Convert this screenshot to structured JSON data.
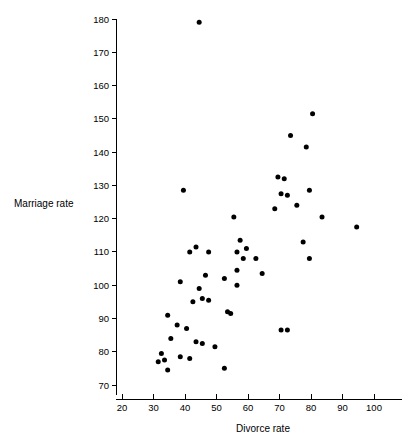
{
  "chart_data": {
    "type": "scatter",
    "title": "",
    "xlabel": "Divorce rate",
    "ylabel": "Marriage rate",
    "xlim": [
      15,
      108
    ],
    "ylim": [
      67,
      182
    ],
    "xticks": [
      20,
      30,
      40,
      50,
      60,
      70,
      80,
      90,
      100
    ],
    "yticks": [
      70,
      80,
      90,
      100,
      110,
      120,
      130,
      140,
      150,
      160,
      170,
      180
    ],
    "grid": false,
    "legend": null,
    "marker": "filled-circle",
    "marker_color": "#000000",
    "points": [
      [
        44.5,
        179
      ],
      [
        80.5,
        151.5
      ],
      [
        78.5,
        141.5
      ],
      [
        73.5,
        145
      ],
      [
        69.5,
        132.5
      ],
      [
        71.5,
        132
      ],
      [
        39.5,
        128.5
      ],
      [
        70.5,
        127.5
      ],
      [
        72.5,
        127
      ],
      [
        79.5,
        128.5
      ],
      [
        68.5,
        123
      ],
      [
        75.5,
        124
      ],
      [
        83.5,
        120.5
      ],
      [
        94.5,
        117.5
      ],
      [
        55.5,
        120.5
      ],
      [
        77.5,
        113
      ],
      [
        57.5,
        113.5
      ],
      [
        59.5,
        111
      ],
      [
        56.5,
        110
      ],
      [
        43.5,
        111.5
      ],
      [
        41.5,
        110
      ],
      [
        47.5,
        110
      ],
      [
        58.5,
        108
      ],
      [
        62.5,
        108
      ],
      [
        79.5,
        108
      ],
      [
        56.5,
        104.5
      ],
      [
        64.5,
        103.5
      ],
      [
        46.5,
        103
      ],
      [
        52.5,
        102
      ],
      [
        38.5,
        101
      ],
      [
        56.5,
        100
      ],
      [
        44.5,
        99
      ],
      [
        45.5,
        96
      ],
      [
        47.5,
        95.5
      ],
      [
        42.5,
        95
      ],
      [
        53.5,
        92
      ],
      [
        54.5,
        91.5
      ],
      [
        34.5,
        91
      ],
      [
        37.5,
        88
      ],
      [
        40.5,
        87
      ],
      [
        70.5,
        86.5
      ],
      [
        72.5,
        86.5
      ],
      [
        35.5,
        84
      ],
      [
        43.5,
        83
      ],
      [
        45.5,
        82.5
      ],
      [
        49.5,
        81.5
      ],
      [
        32.5,
        79.5
      ],
      [
        38.5,
        78.5
      ],
      [
        41.5,
        78
      ],
      [
        33.5,
        77.5
      ],
      [
        31.5,
        77
      ],
      [
        34.5,
        74.5
      ],
      [
        52.5,
        75
      ]
    ]
  },
  "axis": {
    "x_title": "Divorce rate",
    "y_title": "Marriage rate"
  }
}
